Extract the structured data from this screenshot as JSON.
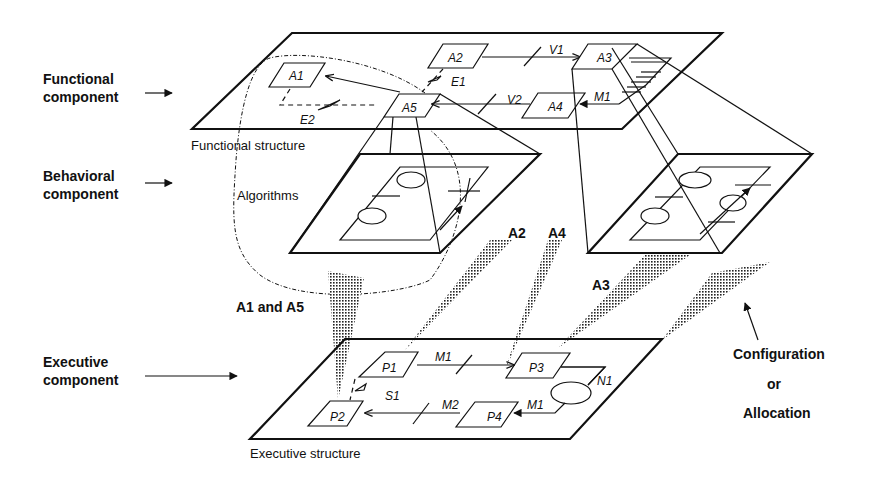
{
  "left_labels": {
    "functional": [
      "Functional",
      "component"
    ],
    "behavioral": [
      "Behavioral",
      "component"
    ],
    "executive": [
      "Executive",
      "component"
    ]
  },
  "functional_structure": {
    "caption": "Functional structure",
    "nodes": [
      "A1",
      "A2",
      "A3",
      "A4",
      "A5"
    ],
    "links": [
      "V1",
      "V2",
      "M1",
      "E1",
      "E2"
    ]
  },
  "behavioral": {
    "caption": "Algorithms"
  },
  "allocation_labels": {
    "a1a5": "A1 and A5",
    "a2": "A2",
    "a4": "A4",
    "a3": "A3"
  },
  "executive_structure": {
    "caption": "Executive structure",
    "nodes": [
      "P1",
      "P2",
      "P3",
      "P4"
    ],
    "links": [
      "M1",
      "M2",
      "S1",
      "M1b",
      "N1"
    ],
    "link_labels": {
      "M1": "M1",
      "M2": "M2",
      "S1": "S1",
      "M1b": "M1",
      "N1": "N1"
    }
  },
  "config_label": [
    "Configuration",
    "or",
    "Allocation"
  ]
}
